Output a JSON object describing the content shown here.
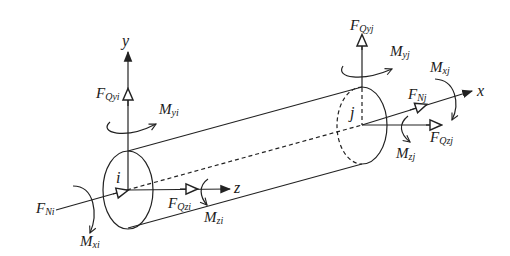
{
  "diagram": {
    "type": "beam-element-force-diagram",
    "colors": {
      "stroke": "#222222",
      "background": "#ffffff"
    },
    "axes": [
      {
        "id": "y",
        "label": "y"
      },
      {
        "id": "z",
        "label": "z"
      },
      {
        "id": "x",
        "label": "x"
      }
    ],
    "nodes": [
      {
        "id": "i",
        "label": "i"
      },
      {
        "id": "j",
        "label": "j"
      }
    ],
    "labels": {
      "FQyi": {
        "main": "F",
        "sub": "Qyi"
      },
      "Myi": {
        "main": "M",
        "sub": "yi"
      },
      "FNi": {
        "main": "F",
        "sub": "Ni"
      },
      "Mxi": {
        "main": "M",
        "sub": "xi"
      },
      "FQzi": {
        "main": "F",
        "sub": "Qzi"
      },
      "Mzi": {
        "main": "M",
        "sub": "zi"
      },
      "FQyj": {
        "main": "F",
        "sub": "Qyj"
      },
      "Myj": {
        "main": "M",
        "sub": "yj"
      },
      "Mxj": {
        "main": "M",
        "sub": "xj"
      },
      "FNj": {
        "main": "F",
        "sub": "Nj"
      },
      "Mzj": {
        "main": "M",
        "sub": "zj"
      },
      "FQzj": {
        "main": "F",
        "sub": "Qzj"
      }
    }
  }
}
